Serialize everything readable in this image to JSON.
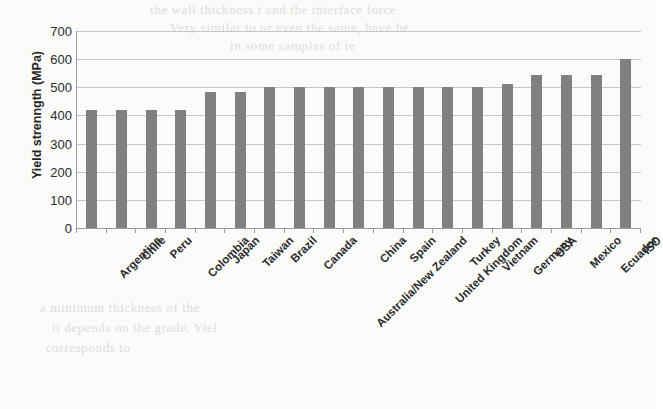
{
  "chart_data": {
    "type": "bar",
    "title": "",
    "xlabel": "",
    "ylabel": "Yield strenngth (MPa)",
    "ylim": [
      0,
      700
    ],
    "ytick_values": [
      0,
      100,
      200,
      300,
      400,
      500,
      600,
      700
    ],
    "grid": true,
    "legend": false,
    "bar_color": "#808080",
    "gridline_color": "#c6c6c6",
    "axis_color": "#9a9a9a",
    "categories": [
      "Argentina",
      "Chile",
      "Peru",
      "Colombia",
      "Japan",
      "Taiwan",
      "Brazil",
      "Canada",
      "Australia/New Zealand",
      "China",
      "Spain",
      "United Kingdom",
      "Turkey",
      "Vietnam",
      "Germany",
      "USA",
      "Mexico",
      "Ecuador",
      "ISO"
    ],
    "values": [
      420,
      420,
      420,
      420,
      485,
      485,
      500,
      500,
      500,
      500,
      500,
      500,
      500,
      500,
      512,
      545,
      545,
      545,
      600
    ]
  },
  "scan_artifacts": {
    "note": "faint bleed-through text from reverse side of scanned page",
    "lines": [
      "the wall thickness t and the interface force",
      "Very similar to or even the same, have be",
      "in some samples of te",
      "a minimum thickness of the",
      "it depends on the grade. Yiel",
      "corresponds to"
    ]
  }
}
